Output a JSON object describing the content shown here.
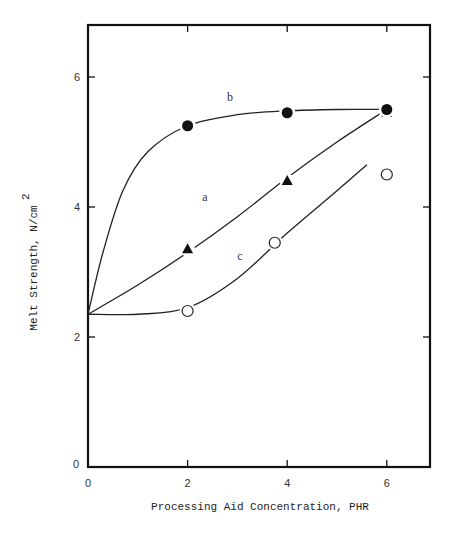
{
  "chart_data": {
    "type": "line",
    "title": "",
    "xlabel": "Processing Aid Concentration, PHR",
    "ylabel": "Melt Strength, N/cm",
    "ylabel_superscript": "2",
    "xlim": [
      0,
      6.85
    ],
    "ylim": [
      0,
      6.7
    ],
    "xticks": [
      0,
      2,
      4,
      6
    ],
    "yticks": [
      0,
      2,
      4,
      6
    ],
    "x_tick_labels": [
      "0",
      "2",
      "4",
      "6"
    ],
    "y_tick_labels": [
      "0",
      "2",
      "4",
      "6"
    ],
    "grid": false,
    "legend": "none (curves labeled inline a, b, c)",
    "series": [
      {
        "name": "a",
        "marker": "filled-triangle",
        "points": [
          [
            2,
            3.35
          ],
          [
            4,
            4.4
          ],
          [
            6,
            5.45
          ]
        ],
        "curve": [
          [
            0,
            2.35
          ],
          [
            1,
            2.8
          ],
          [
            2,
            3.3
          ],
          [
            3,
            3.85
          ],
          [
            4,
            4.45
          ],
          [
            5,
            5.0
          ],
          [
            6,
            5.5
          ]
        ],
        "label_pos": [
          2.35,
          4.15
        ]
      },
      {
        "name": "b",
        "marker": "filled-circle",
        "points": [
          [
            2,
            5.25
          ],
          [
            4,
            5.45
          ],
          [
            6,
            5.5
          ]
        ],
        "curve": [
          [
            0,
            2.35
          ],
          [
            0.3,
            3.3
          ],
          [
            0.7,
            4.25
          ],
          [
            1.2,
            4.85
          ],
          [
            2,
            5.25
          ],
          [
            3,
            5.42
          ],
          [
            4,
            5.48
          ],
          [
            5,
            5.5
          ],
          [
            6,
            5.5
          ]
        ],
        "label_pos": [
          2.85,
          5.7
        ]
      },
      {
        "name": "c",
        "marker": "open-circle",
        "points": [
          [
            2,
            2.4
          ],
          [
            3.75,
            3.45
          ],
          [
            6,
            4.5
          ]
        ],
        "curve": [
          [
            0,
            2.35
          ],
          [
            1,
            2.35
          ],
          [
            2,
            2.45
          ],
          [
            3,
            2.9
          ],
          [
            4,
            3.6
          ],
          [
            5,
            4.25
          ],
          [
            5.6,
            4.65
          ]
        ],
        "label_pos": [
          3.05,
          3.25
        ]
      }
    ]
  },
  "labels": {
    "x_axis_title": "Processing Aid Concentration, PHR",
    "y_axis_title": "Melt Strength, N/cm",
    "y_axis_superscript": "2",
    "y_origin_label": "0"
  }
}
